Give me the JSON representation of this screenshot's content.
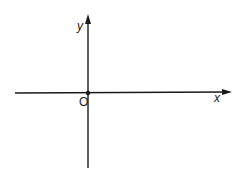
{
  "diagram": {
    "type": "cartesian-axes",
    "x_axis_label": "x",
    "y_axis_label": "y",
    "origin_label": "O",
    "stroke_color": "#1a1a1a",
    "background": "#ffffff"
  }
}
